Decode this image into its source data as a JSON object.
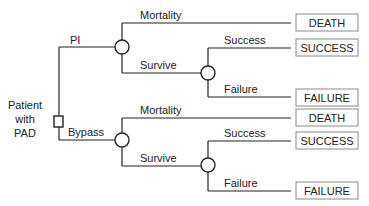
{
  "diagram": {
    "type": "decision-tree",
    "colors": {
      "line": "#222222",
      "box_border": "#8a8a8a",
      "background": "#ffffff"
    },
    "root": {
      "label_lines": [
        "Patient",
        "with",
        "PAD"
      ],
      "node_type": "decision"
    },
    "branches": [
      {
        "label": "PI",
        "node_type": "chance",
        "outcomes": [
          {
            "label": "Mortality",
            "terminal": "DEATH"
          },
          {
            "label": "Survive",
            "node_type": "chance",
            "outcomes": [
              {
                "label": "Success",
                "terminal": "SUCCESS"
              },
              {
                "label": "Failure",
                "terminal": "FAILURE"
              }
            ]
          }
        ]
      },
      {
        "label": "Bypass",
        "node_type": "chance",
        "outcomes": [
          {
            "label": "Mortality",
            "terminal": "DEATH"
          },
          {
            "label": "Survive",
            "node_type": "chance",
            "outcomes": [
              {
                "label": "Success",
                "terminal": "SUCCESS"
              },
              {
                "label": "Failure",
                "terminal": "FAILURE"
              }
            ]
          }
        ]
      }
    ]
  }
}
